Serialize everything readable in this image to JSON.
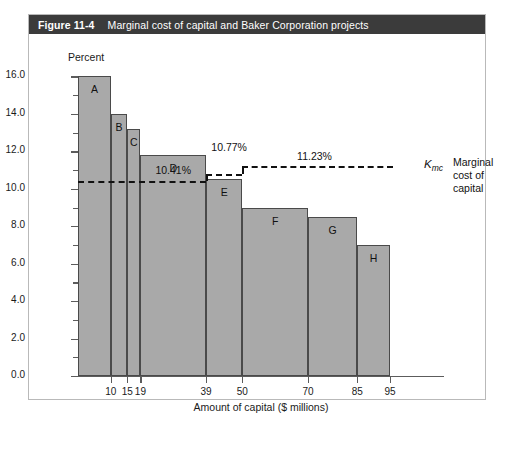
{
  "figure": {
    "number": "Figure 11-4",
    "caption": "Marginal cost of capital and Baker Corporation projects"
  },
  "legend": {
    "symbol": "K",
    "symbol_subscript": "mc",
    "line1": "Marginal",
    "line2": "cost of",
    "line3": "capital"
  },
  "chart_data": {
    "type": "bar",
    "title": "Marginal cost of capital and Baker Corporation projects",
    "xlabel": "Amount of capital ($ millions)",
    "ylabel": "Percent",
    "ylim": [
      0.0,
      16.0
    ],
    "xlim": [
      0,
      111
    ],
    "grid": false,
    "legend_position": "right",
    "y_ticks": [
      "0.0",
      "2.0",
      "4.0",
      "6.0",
      "8.0",
      "10.0",
      "12.0",
      "14.0",
      "16.0"
    ],
    "y_tick_values": [
      0.0,
      2.0,
      4.0,
      6.0,
      8.0,
      10.0,
      12.0,
      14.0,
      16.0
    ],
    "y_minor_tick_values": [
      1.0,
      3.0,
      5.0,
      7.0,
      9.0,
      11.0,
      13.0,
      15.0
    ],
    "x_ticks": [
      "10",
      "15",
      "19",
      "39",
      "50",
      "70",
      "85",
      "95"
    ],
    "x_tick_values": [
      10,
      15,
      19,
      39,
      50,
      70,
      85,
      95
    ],
    "bars": [
      {
        "label": "A",
        "x_start": 0,
        "x_end": 10,
        "value": 16.0
      },
      {
        "label": "B",
        "x_start": 10,
        "x_end": 15,
        "value": 14.0
      },
      {
        "label": "C",
        "x_start": 15,
        "x_end": 19,
        "value": 13.2
      },
      {
        "label": "D",
        "x_start": 19,
        "x_end": 39,
        "value": 11.8
      },
      {
        "label": "E",
        "x_start": 39,
        "x_end": 50,
        "value": 10.5
      },
      {
        "label": "F",
        "x_start": 50,
        "x_end": 70,
        "value": 9.0
      },
      {
        "label": "G",
        "x_start": 70,
        "x_end": 85,
        "value": 8.5
      },
      {
        "label": "H",
        "x_start": 85,
        "x_end": 95,
        "value": 7.0
      }
    ],
    "mcc_line": {
      "name": "Marginal cost of capital",
      "style": "dashed",
      "segments": [
        {
          "x_start": 0,
          "x_end": 39,
          "value": 10.41,
          "value_label": "10.41%"
        },
        {
          "x_start": 39,
          "x_end": 50,
          "value": 10.77,
          "value_label": "10.77%"
        },
        {
          "x_start": 50,
          "x_end": 96,
          "value": 11.23,
          "value_label": "11.23%"
        }
      ]
    }
  }
}
